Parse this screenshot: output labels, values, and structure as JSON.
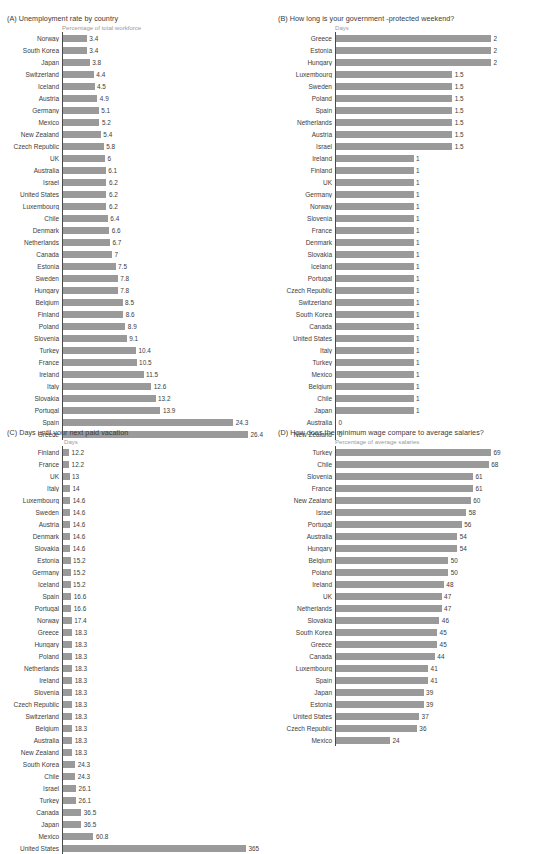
{
  "figure": {
    "caption_label": "FIGURE 1.1",
    "caption_text": "The unicorn经 — comparison across countries"
  },
  "chart_data": [
    {
      "id": "A",
      "type": "bar",
      "orientation": "horizontal",
      "title": "(A) Unemployment rate by country",
      "subtitle": "Percentage of total workforce",
      "xlabel": "Percentage of total workforce",
      "ylabel": "",
      "xlim": [
        0,
        26.4
      ],
      "grid": false,
      "legend": "none",
      "categories": [
        "Norway",
        "South Korea",
        "Japan",
        "Switzerland",
        "Iceland",
        "Austria",
        "Germany",
        "Mexico",
        "New Zealand",
        "Czech Republic",
        "UK",
        "Australia",
        "Israel",
        "United States",
        "Luxembourg",
        "Chile",
        "Denmark",
        "Netherlands",
        "Canada",
        "Estonia",
        "Sweden",
        "Hungary",
        "Belgium",
        "Finland",
        "Poland",
        "Slovenia",
        "Turkey",
        "France",
        "Ireland",
        "Italy",
        "Slovakia",
        "Portugal",
        "Spain",
        "Greece"
      ],
      "values": [
        3.4,
        3.4,
        3.8,
        4.4,
        4.5,
        4.9,
        5.1,
        5.2,
        5.4,
        5.8,
        6,
        6.1,
        6.2,
        6.2,
        6.2,
        6.4,
        6.6,
        6.7,
        7,
        7.5,
        7.8,
        7.8,
        8.5,
        8.6,
        8.9,
        9.1,
        10.4,
        10.5,
        11.5,
        12.6,
        13.2,
        13.9,
        24.3,
        26.4
      ],
      "labels": [
        "3.4",
        "3.4",
        "3.8",
        "4.4",
        "4.5",
        "4.9",
        "5.1",
        "5.2",
        "5.4",
        "5.8",
        "6",
        "6.1",
        "6.2",
        "6.2",
        "6.2",
        "6.4",
        "6.6",
        "6.7",
        "7",
        "7.5",
        "7.8",
        "7.8",
        "8.5",
        "8.6",
        "8.9",
        "9.1",
        "10.4",
        "10.5",
        "11.5",
        "12.6",
        "13.2",
        "13.9",
        "24.3",
        "26.4"
      ]
    },
    {
      "id": "B",
      "type": "bar",
      "orientation": "horizontal",
      "title": "(B) How long is your government -protected weekend?",
      "subtitle": "Days",
      "xlabel": "Days",
      "ylabel": "",
      "xlim": [
        0,
        2
      ],
      "grid": false,
      "legend": "none",
      "categories": [
        "Greece",
        "Estonia",
        "Hungary",
        "Luxembourg",
        "Sweden",
        "Poland",
        "Spain",
        "Netherlands",
        "Austria",
        "Israel",
        "Ireland",
        "Finland",
        "UK",
        "Germany",
        "Norway",
        "Slovenia",
        "France",
        "Denmark",
        "Slovakia",
        "Iceland",
        "Portugal",
        "Czech Republic",
        "Switzerland",
        "South Korea",
        "Canada",
        "United States",
        "Italy",
        "Turkey",
        "Mexico",
        "Belgium",
        "Chile",
        "Japan",
        "Australia",
        "New Zealand"
      ],
      "values": [
        2,
        2,
        2,
        1.5,
        1.5,
        1.5,
        1.5,
        1.5,
        1.5,
        1.5,
        1,
        1,
        1,
        1,
        1,
        1,
        1,
        1,
        1,
        1,
        1,
        1,
        1,
        1,
        1,
        1,
        1,
        1,
        1,
        1,
        1,
        1,
        0,
        0
      ],
      "labels": [
        "2",
        "2",
        "2",
        "1.5",
        "1.5",
        "1.5",
        "1.5",
        "1.5",
        "1.5",
        "1.5",
        "1",
        "1",
        "1",
        "1",
        "1",
        "1",
        "1",
        "1",
        "1",
        "1",
        "1",
        "1",
        "1",
        "1",
        "1",
        "1",
        "1",
        "1",
        "1",
        "1",
        "1",
        "1",
        "0",
        "0"
      ]
    },
    {
      "id": "C",
      "type": "bar",
      "orientation": "horizontal",
      "title": "(C) Days until your next paid vacation",
      "subtitle": "Days",
      "xlabel": "Days",
      "ylabel": "",
      "xlim": [
        0,
        365
      ],
      "grid": false,
      "legend": "none",
      "categories": [
        "Finland",
        "France",
        "UK",
        "Italy",
        "Luxembourg",
        "Sweden",
        "Austria",
        "Denmark",
        "Slovakia",
        "Estonia",
        "Germany",
        "Iceland",
        "Spain",
        "Portugal",
        "Norway",
        "Greece",
        "Hungary",
        "Poland",
        "Netherlands",
        "Ireland",
        "Slovenia",
        "Czech Republic",
        "Switzerland",
        "Belgium",
        "Australia",
        "New Zealand",
        "South Korea",
        "Chile",
        "Israel",
        "Turkey",
        "Canada",
        "Japan",
        "Mexico",
        "United States"
      ],
      "values": [
        12.2,
        12.2,
        13,
        14,
        14.6,
        14.6,
        14.6,
        14.6,
        14.6,
        15.2,
        15.2,
        15.2,
        16.6,
        16.6,
        17.4,
        18.3,
        18.3,
        18.3,
        18.3,
        18.3,
        18.3,
        18.3,
        18.3,
        18.3,
        18.3,
        18.3,
        24.3,
        24.3,
        26.1,
        26.1,
        36.5,
        36.5,
        60.8,
        365
      ],
      "labels": [
        "12.2",
        "12.2",
        "13",
        "14",
        "14.6",
        "14.6",
        "14.6",
        "14.6",
        "14.6",
        "15.2",
        "15.2",
        "15.2",
        "16.6",
        "16.6",
        "17.4",
        "18.3",
        "18.3",
        "18.3",
        "18.3",
        "18.3",
        "18.3",
        "18.3",
        "18.3",
        "18.3",
        "18.3",
        "18.3",
        "24.3",
        "24.3",
        "26.1",
        "26.1",
        "36.5",
        "36.5",
        "60.8",
        "365"
      ]
    },
    {
      "id": "D",
      "type": "bar",
      "orientation": "horizontal",
      "title": "(D) How does the minimum wage compare to average salaries?",
      "subtitle": "Percentage of average salaries",
      "xlabel": "Percentage of average salaries",
      "ylabel": "",
      "xlim": [
        0,
        69
      ],
      "grid": false,
      "legend": "none",
      "categories": [
        "Turkey",
        "Chile",
        "Slovenia",
        "France",
        "New Zealand",
        "Israel",
        "Portugal",
        "Australia",
        "Hungary",
        "Belgium",
        "Poland",
        "Ireland",
        "UK",
        "Netherlands",
        "Slovakia",
        "South Korea",
        "Greece",
        "Canada",
        "Luxembourg",
        "Spain",
        "Japan",
        "Estonia",
        "United States",
        "Czech Republic",
        "Mexico"
      ],
      "values": [
        69,
        68,
        61,
        61,
        60,
        58,
        56,
        54,
        54,
        50,
        50,
        48,
        47,
        47,
        46,
        45,
        45,
        44,
        41,
        41,
        39,
        39,
        37,
        36,
        24
      ],
      "labels": [
        "69",
        "68",
        "61",
        "61",
        "60",
        "58",
        "56",
        "54",
        "54",
        "50",
        "50",
        "48",
        "47",
        "47",
        "46",
        "45",
        "45",
        "44",
        "41",
        "41",
        "39",
        "39",
        "37",
        "36",
        "24"
      ]
    }
  ],
  "colors": {
    "bar": "#9a9a9a",
    "axis": "#4a4a4a",
    "label": "#3c3c3c",
    "subtitle": "#9a9a9a"
  }
}
